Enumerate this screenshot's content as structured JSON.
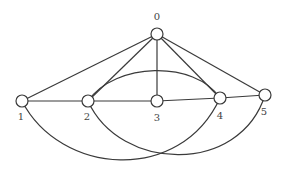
{
  "diagram": {
    "type": "graph",
    "directed": false,
    "nodes": [
      {
        "id": "0",
        "label": "0",
        "x": 157,
        "y": 34,
        "label_x": 157,
        "label_y": 20
      },
      {
        "id": "1",
        "label": "1",
        "x": 22,
        "y": 101,
        "label_x": 21,
        "label_y": 120
      },
      {
        "id": "2",
        "label": "2",
        "x": 88,
        "y": 101,
        "label_x": 87,
        "label_y": 120
      },
      {
        "id": "3",
        "label": "3",
        "x": 157,
        "y": 101,
        "label_x": 157,
        "label_y": 121
      },
      {
        "id": "4",
        "label": "4",
        "x": 220,
        "y": 98,
        "label_x": 220,
        "label_y": 119
      },
      {
        "id": "5",
        "label": "5",
        "x": 265,
        "y": 95,
        "label_x": 264,
        "label_y": 115
      }
    ],
    "edges": [
      {
        "from": "0",
        "to": "1",
        "shape": "line"
      },
      {
        "from": "0",
        "to": "2",
        "shape": "line"
      },
      {
        "from": "0",
        "to": "3",
        "shape": "line"
      },
      {
        "from": "0",
        "to": "4",
        "shape": "line"
      },
      {
        "from": "0",
        "to": "5",
        "shape": "line"
      },
      {
        "from": "1",
        "to": "2",
        "shape": "line"
      },
      {
        "from": "2",
        "to": "3",
        "shape": "line"
      },
      {
        "from": "3",
        "to": "4",
        "shape": "line"
      },
      {
        "from": "4",
        "to": "5",
        "shape": "line"
      },
      {
        "from": "2",
        "to": "4",
        "shape": "arc-up"
      },
      {
        "from": "1",
        "to": "4",
        "shape": "arc-down"
      },
      {
        "from": "2",
        "to": "5",
        "shape": "arc-down"
      }
    ],
    "colors": {
      "stroke": "#3a3a3a",
      "node_fill": "#ffffff",
      "label": "#444444"
    }
  }
}
